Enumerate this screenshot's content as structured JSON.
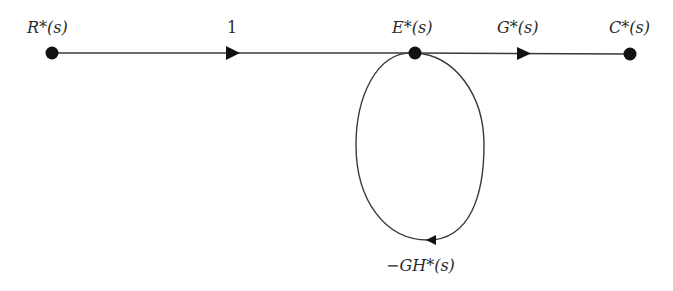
{
  "diagram": {
    "type": "signal-flow-graph",
    "colors": {
      "line": "#3a3a3a",
      "node": "#111111",
      "text": "#2a2a2a",
      "background": "#ffffff"
    },
    "nodes": [
      {
        "id": "R",
        "label": "R*(s)",
        "x": 52,
        "y": 53
      },
      {
        "id": "E",
        "label": "E*(s)",
        "x": 415,
        "y": 53
      },
      {
        "id": "C",
        "label": "C*(s)",
        "x": 630,
        "y": 54
      }
    ],
    "branches": [
      {
        "from": "R",
        "to": "E",
        "gain": "1"
      },
      {
        "from": "E",
        "to": "C",
        "gain": "G*(s)"
      },
      {
        "from": "E",
        "to": "E",
        "gain": "−GH*(s)",
        "kind": "self-loop"
      }
    ],
    "labels": {
      "node_r": "R*(s)",
      "node_e": "E*(s)",
      "node_c": "C*(s)",
      "gain_forward_1": "1",
      "gain_forward_2": "G*(s)",
      "gain_loop": "−GH*(s)"
    }
  }
}
